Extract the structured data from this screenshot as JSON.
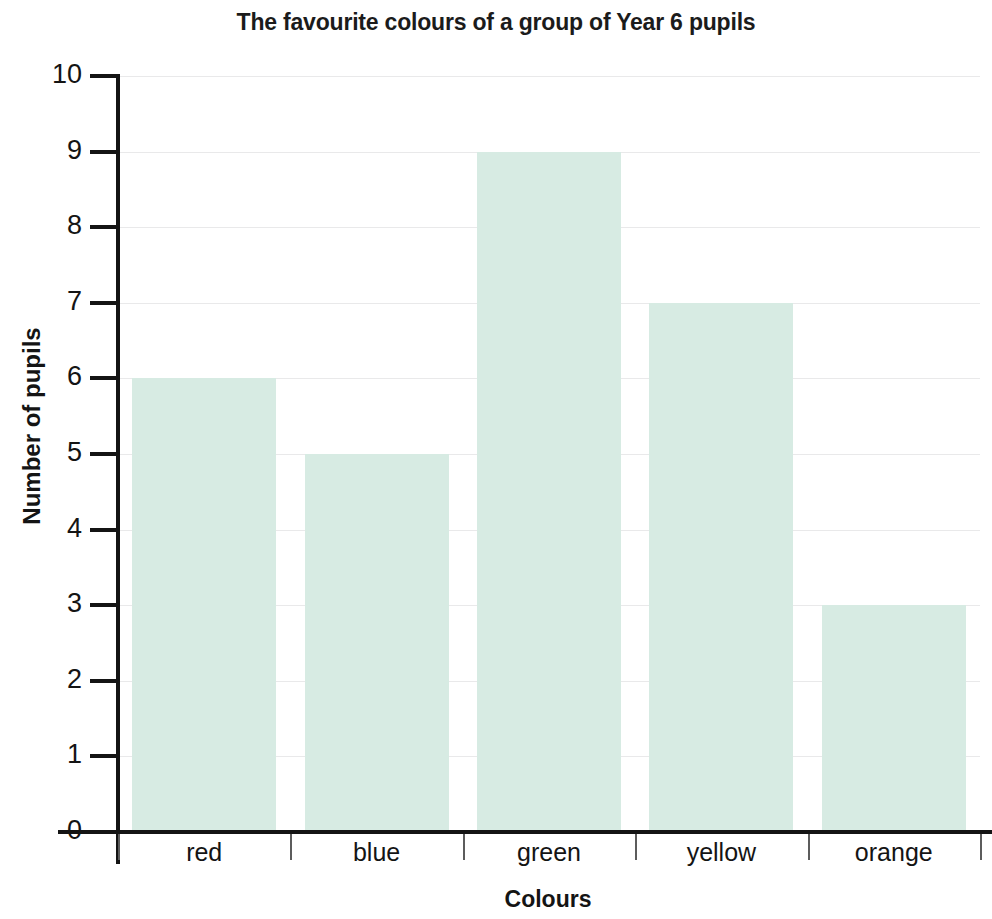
{
  "chart_data": {
    "type": "bar",
    "title": "The favourite colours of a group of Year 6 pupils",
    "xlabel": "Colours",
    "ylabel": "Number of pupils",
    "categories": [
      "red",
      "blue",
      "green",
      "yellow",
      "orange"
    ],
    "values": [
      6,
      5,
      9,
      7,
      3
    ],
    "ylim": [
      0,
      10
    ],
    "ytick_labels": [
      "0",
      "1",
      "2",
      "3",
      "4",
      "5",
      "6",
      "7",
      "8",
      "9",
      "10"
    ],
    "ytick_values": [
      0,
      1,
      2,
      3,
      4,
      5,
      6,
      7,
      8,
      9,
      10
    ],
    "ytick_step": 1,
    "grid": true,
    "legend": false,
    "bar_color": "#d7ebe3",
    "axis_color": "#141414",
    "grid_color": "#e9e9ea",
    "background": "#ffffff"
  }
}
